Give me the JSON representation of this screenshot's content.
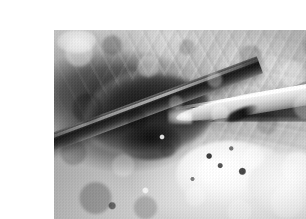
{
  "page": {
    "background_color": "#ffffff",
    "width": 306,
    "height": 219
  },
  "photograph": {
    "alt_text": "Grayscale intraoperative photograph of a surgical field",
    "frame": {
      "left": 14,
      "top": 14,
      "width": 277,
      "height": 191,
      "border_color": "#ffffff"
    },
    "palette": {
      "darkest": "#111111",
      "dark": "#2b2b2b",
      "mid": "#9a9a9a",
      "light": "#d8d8d8",
      "brightest": "#ffffff"
    },
    "regions": [
      {
        "name": "dark-cavity",
        "description": "Large dark cavity or resected lesion in the left-of-centre portion of the field"
      },
      {
        "name": "secondary-cavity",
        "description": "Smaller deep dark pocket below and right of the main cavity"
      },
      {
        "name": "fibrous-tissue",
        "description": "Striated fibrous tissue with radiating pale bands filling the upper and right portions"
      },
      {
        "name": "bright-tissue-mass",
        "description": "Brightly illuminated pale tissue mass across the lower centre and lower right"
      },
      {
        "name": "corner-highlight",
        "description": "Bright specular highlight at the upper-left corner of the field"
      },
      {
        "name": "shadow-wedge",
        "description": "Dark triangular shadow cast above the instrument on the right"
      }
    ],
    "instruments": [
      {
        "name": "dark-instrument-shaft",
        "description": "Dark metallic instrument shaft crossing diagonally from the lower left toward the upper right",
        "angle_degrees": -20.5,
        "tone": "dark"
      },
      {
        "name": "light-instrument-shaft",
        "description": "Pale tapered instrument entering from the right edge and angling toward the centre",
        "angle_degrees": -9.5,
        "tone": "light"
      }
    ]
  }
}
